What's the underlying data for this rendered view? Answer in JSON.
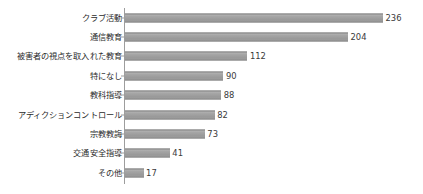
{
  "chart_data": {
    "type": "bar",
    "orientation": "horizontal",
    "title": "",
    "subtitle": "",
    "xlabel": "",
    "ylabel": "",
    "grid": false,
    "legend": false,
    "xlim": [
      0,
      236
    ],
    "categories": [
      "クラブ活動",
      "通信教育",
      "被害者の視点を取入れた教育",
      "特になし",
      "教科指導",
      "アディクションコントロール",
      "宗教教誨",
      "交通安全指導",
      "その他"
    ],
    "values": [
      236,
      204,
      112,
      90,
      88,
      82,
      73,
      41,
      17
    ],
    "value_labels": [
      "236",
      "204",
      "112",
      "90",
      "88",
      "82",
      "73",
      "41",
      "17"
    ],
    "colors": {
      "bar_fill": "#9c9c9c",
      "bar_edge": "#8a8a8a",
      "axis": "#9d9d9d",
      "text": "#2b2b2b",
      "background": "#ffffff"
    },
    "rows": [
      {
        "label": "クラブ活動",
        "value": 236,
        "value_label": "236"
      },
      {
        "label": "通信教育",
        "value": 204,
        "value_label": "204"
      },
      {
        "label": "被害者の視点を取入れた教育",
        "value": 112,
        "value_label": "112"
      },
      {
        "label": "特になし",
        "value": 90,
        "value_label": "90"
      },
      {
        "label": "教科指導",
        "value": 88,
        "value_label": "88"
      },
      {
        "label": "アディクションコントロール",
        "value": 82,
        "value_label": "82"
      },
      {
        "label": "宗教教誨",
        "value": 73,
        "value_label": "73"
      },
      {
        "label": "交通安全指導",
        "value": 41,
        "value_label": "41"
      },
      {
        "label": "その他",
        "value": 17,
        "value_label": "17"
      }
    ]
  }
}
